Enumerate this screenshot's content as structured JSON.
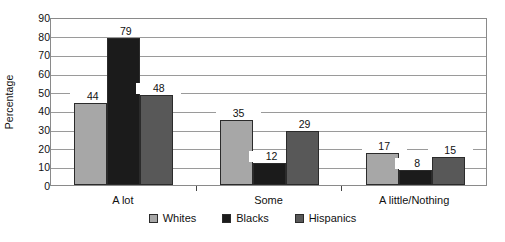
{
  "chart_data": {
    "type": "bar",
    "title": "",
    "subtitle": "",
    "xlabel": "",
    "ylabel": "Percentage",
    "ylim": [
      0,
      90
    ],
    "yticks": [
      0,
      10,
      20,
      30,
      40,
      50,
      60,
      70,
      80,
      90
    ],
    "ytick_labels": [
      "0",
      "10",
      "20",
      "30",
      "40",
      "50",
      "60",
      "70",
      "80",
      "90"
    ],
    "grid": true,
    "legend_position": "bottom",
    "categories": [
      "A lot",
      "Some",
      "A little/Nothing"
    ],
    "series": [
      {
        "name": "Whites",
        "color": "#a7a7a7",
        "values": [
          44,
          79,
          48
        ]
      },
      {
        "name": "Blacks",
        "color": "#1b1b1b",
        "values": [
          35,
          12,
          29
        ]
      },
      {
        "name": "Hispanics",
        "color": "#585858",
        "values": [
          17,
          8,
          15
        ]
      }
    ],
    "groups": [
      {
        "category": "A lot",
        "bars": [
          {
            "series": "Whites",
            "value": 44,
            "label": "44"
          },
          {
            "series": "Blacks",
            "value": 79,
            "label": "79"
          },
          {
            "series": "Hispanics",
            "value": 48,
            "label": "48"
          }
        ]
      },
      {
        "category": "Some",
        "bars": [
          {
            "series": "Whites",
            "value": 35,
            "label": "35"
          },
          {
            "series": "Blacks",
            "value": 12,
            "label": "12"
          },
          {
            "series": "Hispanics",
            "value": 29,
            "label": "29"
          }
        ]
      },
      {
        "category": "A little/Nothing",
        "bars": [
          {
            "series": "Whites",
            "value": 17,
            "label": "17"
          },
          {
            "series": "Blacks",
            "value": 8,
            "label": "8"
          },
          {
            "series": "Hispanics",
            "value": 15,
            "label": "15"
          }
        ]
      }
    ]
  },
  "legend": {
    "items": [
      {
        "label": "Whites",
        "color": "#a7a7a7"
      },
      {
        "label": "Blacks",
        "color": "#1b1b1b"
      },
      {
        "label": "Hispanics",
        "color": "#585858"
      }
    ]
  }
}
